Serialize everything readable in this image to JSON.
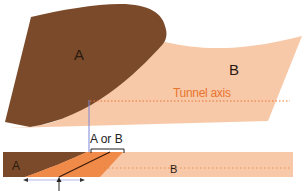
{
  "diagram": {
    "top_section": {
      "label_a": "A",
      "label_b": "B",
      "axis_label": "Tunnel axis"
    },
    "bottom_section": {
      "label_a": "A",
      "label_b": "B",
      "bracket_label": "A or B"
    },
    "colors": {
      "material_a": "#7a4a2a",
      "material_b": "#f8c9a8",
      "transition_wedge": "#f08a48",
      "axis_line": "#e8742e",
      "vertical_marker": "#7a86d8",
      "text_dark": "#2a1a10"
    },
    "icons": {
      "arrow_left": "arrow-left-icon",
      "arrow_right": "arrow-right-icon",
      "arrow_up": "arrow-up-icon"
    }
  }
}
